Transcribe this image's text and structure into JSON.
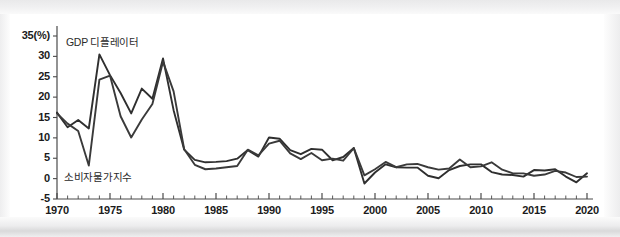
{
  "chart_data": {
    "type": "line",
    "title": "",
    "subtitle": "",
    "xlabel": "",
    "ylabel": "",
    "y_unit_label": "35(%)",
    "xlim": [
      1970,
      2020
    ],
    "ylim": [
      -5,
      35
    ],
    "grid": false,
    "legend_position": "inline-annotation",
    "y_ticks": [
      35,
      30,
      25,
      20,
      15,
      10,
      5,
      0,
      -5
    ],
    "y_tick_labels": [
      "35(%)",
      "30",
      "25",
      "20",
      "15",
      "10",
      "5",
      "0",
      "-5"
    ],
    "x_ticks": [
      1970,
      1975,
      1980,
      1985,
      1990,
      1995,
      2000,
      2005,
      2010,
      2015,
      2020
    ],
    "x_tick_labels": [
      "1970",
      "1975",
      "1980",
      "1985",
      "1990",
      "1995",
      "2000",
      "2005",
      "2010",
      "2015",
      "2020"
    ],
    "x_minor_tick_interval": 1,
    "x": [
      1970,
      1971,
      1972,
      1973,
      1974,
      1975,
      1976,
      1977,
      1978,
      1979,
      1980,
      1981,
      1982,
      1983,
      1984,
      1985,
      1986,
      1987,
      1988,
      1989,
      1990,
      1991,
      1992,
      1993,
      1994,
      1995,
      1996,
      1997,
      1998,
      1999,
      2000,
      2001,
      2002,
      2003,
      2004,
      2005,
      2006,
      2007,
      2008,
      2009,
      2010,
      2011,
      2012,
      2013,
      2014,
      2015,
      2016,
      2017,
      2018,
      2019,
      2020
    ],
    "series": [
      {
        "name": "GDP 디플레이터",
        "color": "#2f2f2f",
        "values": [
          16.2,
          12.6,
          14.4,
          12.3,
          30.5,
          25.4,
          21.0,
          16.0,
          22.1,
          19.6,
          29.5,
          16.8,
          7.1,
          4.6,
          4.0,
          4.1,
          4.3,
          4.9,
          7.0,
          5.4,
          10.1,
          9.8,
          7.0,
          6.0,
          7.3,
          7.1,
          4.5,
          5.3,
          7.5,
          -1.2,
          1.5,
          3.5,
          2.8,
          2.7,
          2.7,
          0.7,
          0.1,
          2.1,
          3.1,
          3.5,
          3.5,
          1.6,
          1.0,
          0.9,
          0.5,
          2.1,
          2.0,
          2.3,
          0.5,
          -0.9,
          1.3
        ]
      },
      {
        "name": "소비자물가지수",
        "color": "#3a3a3a",
        "values": [
          16.0,
          13.5,
          11.7,
          3.2,
          24.3,
          25.3,
          15.3,
          10.1,
          14.5,
          18.3,
          28.7,
          21.4,
          7.2,
          3.4,
          2.3,
          2.5,
          2.8,
          3.1,
          7.1,
          5.7,
          8.6,
          9.3,
          6.2,
          4.8,
          6.3,
          4.5,
          4.9,
          4.4,
          7.5,
          0.8,
          2.3,
          4.1,
          2.8,
          3.5,
          3.6,
          2.8,
          2.2,
          2.5,
          4.7,
          2.8,
          3.0,
          4.0,
          2.2,
          1.3,
          1.3,
          0.7,
          1.0,
          1.9,
          1.5,
          0.4,
          0.5
        ]
      }
    ],
    "annotations": [
      {
        "text": "GDP 디플레이터",
        "x_px": 66,
        "y_px": 34
      },
      {
        "text": "소비자물가지수",
        "x_px": 64,
        "y_px": 169
      }
    ]
  },
  "axis": {
    "y_labels": [
      "35(%)",
      "30",
      "25",
      "20",
      "15",
      "10",
      "5",
      "0",
      "-5"
    ],
    "x_labels": [
      "1970",
      "1975",
      "1980",
      "1985",
      "1990",
      "1995",
      "2000",
      "2005",
      "2010",
      "2015",
      "2020"
    ]
  },
  "colors": {
    "line_primary": "#2f2f2f",
    "line_secondary": "#3a3a3a",
    "axis": "#4a4a4a",
    "text": "#1b1b1b",
    "background": "#ffffff"
  }
}
